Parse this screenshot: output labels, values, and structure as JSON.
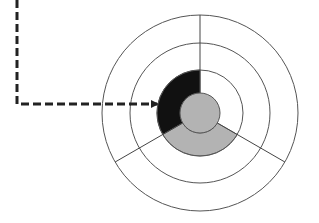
{
  "diagram": {
    "type": "concentric-sector-diagram",
    "center": [
      200,
      113
    ],
    "rings": [
      {
        "name": "outer-ring",
        "radius": 98
      },
      {
        "name": "middle-ring",
        "radius": 70
      },
      {
        "name": "inner-ring",
        "radius": 43
      }
    ],
    "core": {
      "radius": 20,
      "fill": "#b3b3b3"
    },
    "dividers_deg": [
      -90,
      30,
      150
    ],
    "sectors": [
      {
        "name": "upper-left",
        "start_deg": 150,
        "end_deg": 270,
        "fill": "#111111"
      },
      {
        "name": "bottom",
        "start_deg": 30,
        "end_deg": 150,
        "fill": "#b3b3b3"
      },
      {
        "name": "upper-right",
        "start_deg": -90,
        "end_deg": 30,
        "fill": "#ffffff"
      }
    ],
    "connector": {
      "style": "dashed",
      "points": [
        [
          17,
          0
        ],
        [
          17,
          104
        ],
        [
          157,
          104
        ]
      ],
      "arrowhead": "end",
      "color": "#222222"
    },
    "colors": {
      "stroke": "#555555",
      "dark": "#111111",
      "gray": "#b3b3b3",
      "background": "#ffffff"
    }
  }
}
